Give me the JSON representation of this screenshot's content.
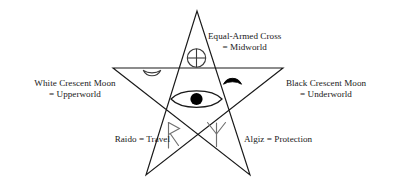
{
  "figure": {
    "background_color": "#ffffff",
    "line_color": "#1a1a1a",
    "text_color": "#181818",
    "fill_black": "#000000"
  },
  "diagram": {
    "shape": "pentagram",
    "vertices_note": "five-pointed star drawn as one continuous crossing path",
    "points": [
      {
        "name": "apex",
        "x": 197,
        "y": 11
      },
      {
        "name": "right-arm",
        "x": 283,
        "y": 68
      },
      {
        "name": "bottom-right-leg",
        "x": 250,
        "y": 175
      },
      {
        "name": "bottom-left-leg",
        "x": 146,
        "y": 175
      },
      {
        "name": "left-arm",
        "x": 113,
        "y": 68
      }
    ]
  },
  "symbols": [
    {
      "id": "equal-armed-cross",
      "icon": "circled-cross-icon",
      "position": "upper-middle",
      "fill": "outline",
      "label_line1": "Equal-Armed Cross",
      "label_line2": "= Midworld",
      "meaning": "Midworld"
    },
    {
      "id": "white-crescent-moon",
      "icon": "crescent-moon-outline-icon",
      "position": "upper-left",
      "fill": "outline",
      "label_line1": "White Crescent Moon",
      "label_line2": "= Upperworld",
      "meaning": "Upperworld"
    },
    {
      "id": "black-crescent-moon",
      "icon": "crescent-moon-filled-icon",
      "position": "upper-right",
      "fill": "solid-black",
      "label_line1": "Black Crescent Moon",
      "label_line2": "= Underworld",
      "meaning": "Underworld"
    },
    {
      "id": "raido-rune",
      "icon": "raido-rune-icon",
      "position": "lower-left",
      "fill": "outline",
      "label_line1": "Raido = Travel",
      "label_line2": "",
      "meaning": "Travel"
    },
    {
      "id": "algiz-rune",
      "icon": "algiz-rune-icon",
      "position": "lower-right",
      "fill": "outline",
      "label_line1": "Algiz = Protection",
      "label_line2": "",
      "meaning": "Protection"
    },
    {
      "id": "eye",
      "icon": "eye-icon",
      "position": "center",
      "fill": "outline-with-black-pupil",
      "label_line1": "",
      "label_line2": "",
      "meaning": ""
    }
  ],
  "labels": {
    "cross_line1": "Equal-Armed Cross",
    "cross_line2": "= Midworld",
    "white_line1": "White Crescent Moon",
    "white_line2": "= Upperworld",
    "black_line1": "Black Crescent Moon",
    "black_line2": "= Underworld",
    "raido": "Raido = Travel",
    "algiz": "Algiz = Protection"
  }
}
